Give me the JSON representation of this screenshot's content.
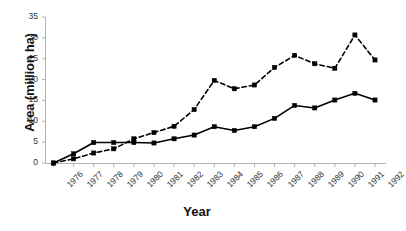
{
  "chart_data": {
    "type": "line",
    "title": "",
    "xlabel": "Year",
    "ylabel": "Area (million ha)",
    "x": [
      1976,
      1977,
      1978,
      1979,
      1980,
      1981,
      1982,
      1983,
      1984,
      1985,
      1986,
      1987,
      1988,
      1989,
      1990,
      1991,
      1992
    ],
    "categories": [
      "1976",
      "1977",
      "1978",
      "1979",
      "1980",
      "1981",
      "1982",
      "1983",
      "1984",
      "1985",
      "1986",
      "1987",
      "1988",
      "1989",
      "1990",
      "1991",
      "1992"
    ],
    "series": [
      {
        "name": "solid-series",
        "style": "solid",
        "marker": "square",
        "color": "#000000",
        "values": [
          0.0,
          2.2,
          4.9,
          4.9,
          4.9,
          4.8,
          5.8,
          6.7,
          8.7,
          7.8,
          8.7,
          10.7,
          13.8,
          13.2,
          15.1,
          16.7,
          15.1
        ]
      },
      {
        "name": "dashed-series",
        "style": "dashed",
        "marker": "square",
        "color": "#000000",
        "values": [
          0.0,
          1.0,
          2.4,
          3.4,
          5.8,
          7.3,
          8.8,
          12.8,
          19.8,
          17.8,
          18.7,
          22.9,
          25.8,
          23.8,
          22.7,
          30.7,
          24.7
        ]
      }
    ],
    "ylim": [
      0,
      35
    ],
    "yticks": [
      0,
      5,
      10,
      15,
      20,
      25,
      30,
      35
    ],
    "ytick_labels": [
      "0",
      "5",
      "10",
      "15",
      "20",
      "25",
      "30",
      "35"
    ],
    "xtick_labels": [
      "1976",
      "1977",
      "1978",
      "1979",
      "1980",
      "1981",
      "1982",
      "1983",
      "1984",
      "1985",
      "1986",
      "1987",
      "1988",
      "1989",
      "1990",
      "1991",
      "1992"
    ],
    "xtick_rotation": -45,
    "grid": false,
    "legend": "none",
    "axis_color": "#b0b0b0",
    "text_color": "#333333",
    "background": "#ffffff"
  },
  "axes": {
    "y_title": "Area (million ha)",
    "x_title": "Year"
  }
}
